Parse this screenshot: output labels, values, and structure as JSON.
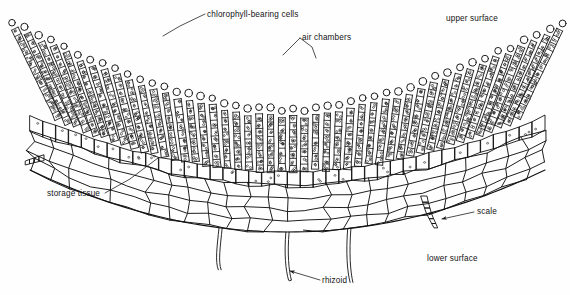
{
  "figure": {
    "background_color": "#fefefe",
    "ink_color": "#121212"
  },
  "labels": [
    {
      "id": "chlorophyll-bearing-cells",
      "text": "chlorophyll-bearing cells",
      "x": 207,
      "y": 17,
      "anchor": "start",
      "leader": "M205,14 L180,26 L163,36",
      "has_arrow": false
    },
    {
      "id": "air-chambers",
      "text": "air chambers",
      "x": 302,
      "y": 40,
      "anchor": "start",
      "leader": "M300,38 L283,55 M300,38 L312,47 L316,58",
      "has_arrow": false
    },
    {
      "id": "upper-surface",
      "text": "upper surface",
      "x": 446,
      "y": 21,
      "anchor": "start",
      "leader": "",
      "has_arrow": false
    },
    {
      "id": "storage-tissue",
      "text": "storage tissue",
      "x": 47,
      "y": 196,
      "anchor": "start",
      "leader": "M105,193 L130,179 L158,158",
      "has_arrow": false
    },
    {
      "id": "scale",
      "text": "scale",
      "x": 477,
      "y": 214,
      "anchor": "start",
      "leader": "M474,212 L442,219",
      "has_arrow": true
    },
    {
      "id": "lower-surface",
      "text": "lower surface",
      "x": 427,
      "y": 261,
      "anchor": "start",
      "leader": "",
      "has_arrow": false
    },
    {
      "id": "rhizoid",
      "text": "rhizoid",
      "x": 322,
      "y": 283,
      "anchor": "start",
      "leader": "M320,280 L290,271",
      "has_arrow": true
    }
  ],
  "structure": {
    "filament_count": 46,
    "cap_cell_shape": "circle",
    "storage_rows": 4,
    "rhizoid_count": 3,
    "scale_count": 2,
    "scale_cells": 6
  }
}
